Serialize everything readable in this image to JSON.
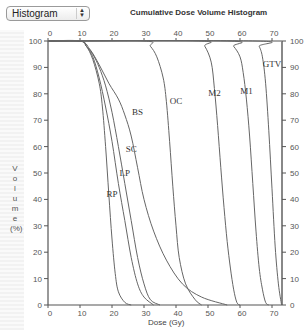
{
  "toolbar": {
    "view_select": {
      "value": "Histogram"
    }
  },
  "chart_data": {
    "type": "line",
    "title": "Cumulative Dose Volume Histogram",
    "xlabel": "Dose (Gy)",
    "ylabel": "Volume (%)",
    "xlim": [
      0,
      73
    ],
    "ylim": [
      0,
      100
    ],
    "x_ticks": [
      0,
      10,
      20,
      30,
      40,
      50,
      60,
      70
    ],
    "y_ticks": [
      0,
      10,
      20,
      30,
      40,
      50,
      60,
      70,
      80,
      90,
      100
    ],
    "grid": false,
    "legend": "inline labels on curves",
    "series": [
      {
        "name": "RP",
        "label_at": [
          20,
          41
        ],
        "points": [
          [
            0,
            100
          ],
          [
            10,
            100
          ],
          [
            12,
            98
          ],
          [
            14,
            93
          ],
          [
            16,
            84
          ],
          [
            17,
            75
          ],
          [
            18,
            60
          ],
          [
            19,
            42
          ],
          [
            20,
            25
          ],
          [
            21,
            12
          ],
          [
            22,
            5
          ],
          [
            24,
            1
          ],
          [
            26,
            0
          ]
        ]
      },
      {
        "name": "LP",
        "label_at": [
          24,
          49
        ],
        "points": [
          [
            0,
            100
          ],
          [
            10,
            100
          ],
          [
            12,
            98
          ],
          [
            14,
            94
          ],
          [
            16,
            86
          ],
          [
            18,
            75
          ],
          [
            20,
            62
          ],
          [
            22,
            46
          ],
          [
            24,
            32
          ],
          [
            26,
            18
          ],
          [
            28,
            8
          ],
          [
            30,
            3
          ],
          [
            33,
            0
          ]
        ]
      },
      {
        "name": "SC",
        "label_at": [
          26,
          58
        ],
        "points": [
          [
            0,
            100
          ],
          [
            10,
            100
          ],
          [
            12,
            98
          ],
          [
            14,
            95
          ],
          [
            16,
            90
          ],
          [
            18,
            83
          ],
          [
            20,
            73
          ],
          [
            22,
            60
          ],
          [
            24,
            46
          ],
          [
            26,
            32
          ],
          [
            28,
            18
          ],
          [
            30,
            8
          ],
          [
            32,
            2
          ],
          [
            35,
            0
          ]
        ]
      },
      {
        "name": "BS",
        "label_at": [
          28,
          72
        ],
        "points": [
          [
            0,
            100
          ],
          [
            10,
            100
          ],
          [
            13,
            97
          ],
          [
            16,
            91
          ],
          [
            19,
            84
          ],
          [
            22,
            78
          ],
          [
            24,
            72
          ],
          [
            26,
            64
          ],
          [
            28,
            52
          ],
          [
            30,
            40
          ],
          [
            33,
            28
          ],
          [
            37,
            17
          ],
          [
            42,
            8
          ],
          [
            48,
            3
          ],
          [
            56,
            0
          ]
        ]
      },
      {
        "name": "OC",
        "label_at": [
          40,
          76
        ],
        "points": [
          [
            0,
            100
          ],
          [
            30,
            100
          ],
          [
            32,
            98
          ],
          [
            34,
            94
          ],
          [
            36,
            86
          ],
          [
            37,
            77
          ],
          [
            38,
            62
          ],
          [
            39,
            45
          ],
          [
            40,
            30
          ],
          [
            41,
            18
          ],
          [
            43,
            8
          ],
          [
            46,
            2
          ],
          [
            48,
            0
          ]
        ]
      },
      {
        "name": "M2",
        "label_at": [
          52,
          79
        ],
        "points": [
          [
            0,
            100
          ],
          [
            47,
            100
          ],
          [
            49,
            98
          ],
          [
            51,
            92
          ],
          [
            52,
            82
          ],
          [
            53,
            68
          ],
          [
            54,
            52
          ],
          [
            55,
            37
          ],
          [
            56,
            24
          ],
          [
            57,
            14
          ],
          [
            58,
            6
          ],
          [
            59,
            1
          ],
          [
            60,
            0
          ]
        ]
      },
      {
        "name": "M1",
        "label_at": [
          62,
          80
        ],
        "points": [
          [
            0,
            100
          ],
          [
            56,
            100
          ],
          [
            58,
            98
          ],
          [
            60,
            94
          ],
          [
            61,
            88
          ],
          [
            62,
            78
          ],
          [
            63,
            64
          ],
          [
            64,
            46
          ],
          [
            65,
            28
          ],
          [
            66,
            14
          ],
          [
            67,
            6
          ],
          [
            68,
            1
          ],
          [
            69,
            0
          ]
        ]
      },
      {
        "name": "GTV",
        "label_at": [
          70,
          90
        ],
        "points": [
          [
            0,
            100
          ],
          [
            65,
            100
          ],
          [
            66,
            98
          ],
          [
            67,
            94
          ],
          [
            68,
            84
          ],
          [
            69,
            66
          ],
          [
            70,
            44
          ],
          [
            71,
            22
          ],
          [
            72,
            8
          ],
          [
            73,
            0
          ]
        ]
      }
    ]
  }
}
